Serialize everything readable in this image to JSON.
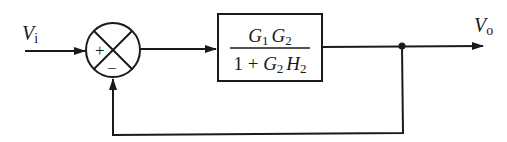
{
  "diagram": {
    "type": "block-diagram",
    "input_label": {
      "main": "V",
      "sub": "i"
    },
    "output_label": {
      "main": "V",
      "sub": "o"
    },
    "summing_junction": {
      "plus_sign": "+",
      "minus_sign": "−"
    },
    "block": {
      "numerator": {
        "G1": "G",
        "G1_sub": "1",
        "G2": "G",
        "G2_sub": "2"
      },
      "denominator": {
        "one_plus": "1 + ",
        "G2": "G",
        "G2_sub": "2",
        "H2": "H",
        "H2_sub": "2"
      }
    },
    "connections": [
      "input -> summing_junction(+)",
      "summing_junction -> block",
      "block -> output",
      "output -> feedback -> summing_junction(-)"
    ],
    "line_color": "#1a1a1a"
  }
}
